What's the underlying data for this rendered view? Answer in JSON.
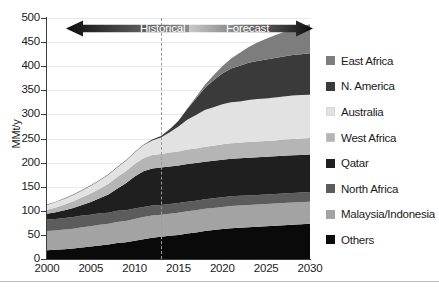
{
  "chart_data": {
    "type": "area",
    "title": "",
    "xlabel": "",
    "ylabel": "MMt/y",
    "xlim": [
      2000,
      2030
    ],
    "ylim": [
      0,
      500
    ],
    "grid": true,
    "legend_position": "right",
    "stacked": true,
    "x": [
      2000,
      2001,
      2002,
      2003,
      2004,
      2005,
      2006,
      2007,
      2008,
      2009,
      2010,
      2011,
      2012,
      2013,
      2014,
      2015,
      2016,
      2017,
      2018,
      2019,
      2020,
      2021,
      2022,
      2023,
      2024,
      2025,
      2026,
      2027,
      2028,
      2029,
      2030
    ],
    "xticks": [
      "2000",
      "2005",
      "2010",
      "2015",
      "2020",
      "2025",
      "2030"
    ],
    "yticks": [
      "0",
      "50",
      "100",
      "150",
      "200",
      "250",
      "300",
      "350",
      "400",
      "450",
      "500"
    ],
    "series": [
      {
        "name": "Others",
        "color": "#0a0a0a",
        "values": [
          18,
          19,
          20,
          22,
          24,
          26,
          28,
          30,
          33,
          35,
          38,
          41,
          44,
          46,
          48,
          50,
          53,
          55,
          58,
          60,
          62,
          64,
          65,
          66,
          67,
          68,
          69,
          70,
          71,
          72,
          73
        ]
      },
      {
        "name": "Malaysia/Indonesia",
        "color": "#a3a3a3",
        "values": [
          40,
          40,
          41,
          41,
          42,
          42,
          43,
          43,
          44,
          44,
          45,
          46,
          46,
          46,
          46,
          46,
          46,
          46,
          46,
          46,
          46,
          46,
          46,
          46,
          46,
          46,
          46,
          46,
          46,
          46,
          46
        ]
      },
      {
        "name": "North Africa",
        "color": "#5c5c5c",
        "values": [
          24,
          24,
          24,
          24,
          24,
          24,
          24,
          23,
          23,
          22,
          22,
          21,
          21,
          20,
          20,
          20,
          20,
          20,
          20,
          20,
          20,
          20,
          20,
          20,
          20,
          20,
          20,
          20,
          20,
          20,
          20
        ]
      },
      {
        "name": "Qatar",
        "color": "#1f1f1f",
        "values": [
          12,
          14,
          16,
          19,
          22,
          26,
          31,
          38,
          46,
          56,
          66,
          74,
          77,
          78,
          78,
          78,
          78,
          78,
          78,
          78,
          78,
          78,
          78,
          78,
          78,
          78,
          78,
          78,
          78,
          78,
          78
        ]
      },
      {
        "name": "West Africa",
        "color": "#b5b5b5",
        "values": [
          8,
          10,
          12,
          14,
          16,
          18,
          20,
          22,
          24,
          25,
          26,
          27,
          28,
          28,
          29,
          29,
          30,
          30,
          31,
          31,
          32,
          32,
          32,
          33,
          33,
          33,
          33,
          34,
          34,
          34,
          34
        ]
      },
      {
        "name": "Australia",
        "color": "#e2e2e2",
        "values": [
          10,
          11,
          12,
          13,
          14,
          16,
          17,
          19,
          20,
          22,
          24,
          27,
          30,
          34,
          42,
          52,
          62,
          70,
          76,
          80,
          83,
          85,
          86,
          87,
          88,
          88,
          89,
          89,
          90,
          90,
          90
        ]
      },
      {
        "name": "N. America",
        "color": "#3a3a3a",
        "values": [
          1,
          1,
          1,
          1,
          1,
          1,
          1,
          1,
          1,
          1,
          1,
          1,
          2,
          3,
          6,
          12,
          22,
          34,
          46,
          56,
          64,
          70,
          74,
          77,
          79,
          81,
          82,
          83,
          84,
          85,
          86
        ]
      },
      {
        "name": "East Africa",
        "color": "#7d7d7d",
        "values": [
          0,
          0,
          0,
          0,
          0,
          0,
          0,
          0,
          0,
          0,
          0,
          0,
          0,
          0,
          0,
          0,
          1,
          3,
          6,
          10,
          15,
          21,
          27,
          33,
          38,
          43,
          47,
          51,
          54,
          57,
          60
        ]
      }
    ],
    "annotations": {
      "divider_year": 2013,
      "arrow_band": {
        "historical_label": "Historical",
        "forecast_label": "Forecast"
      }
    }
  },
  "legend": {
    "items": [
      {
        "label": "East Africa",
        "color": "#7d7d7d"
      },
      {
        "label": "N. America",
        "color": "#3a3a3a"
      },
      {
        "label": "Australia",
        "color": "#e2e2e2"
      },
      {
        "label": "West Africa",
        "color": "#b5b5b5"
      },
      {
        "label": "Qatar",
        "color": "#1f1f1f"
      },
      {
        "label": "North Africa",
        "color": "#5c5c5c"
      },
      {
        "label": "Malaysia/Indonesia",
        "color": "#a3a3a3"
      },
      {
        "label": "Others",
        "color": "#0a0a0a"
      }
    ]
  },
  "caption": {
    "text": ""
  }
}
